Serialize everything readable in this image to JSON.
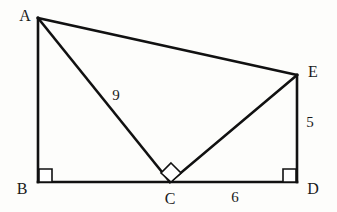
{
  "figure": {
    "background_color": "#fdfdfb",
    "stroke_color": "#111111",
    "label_color": "#1a1a1a",
    "width": 337,
    "height": 212,
    "vertices": [
      {
        "name": "A",
        "label": "A",
        "x": 38,
        "y": 18,
        "label_x": 25,
        "label_y": 16
      },
      {
        "name": "B",
        "label": "B",
        "x": 38,
        "y": 182,
        "label_x": 22,
        "label_y": 189
      },
      {
        "name": "C",
        "label": "C",
        "x": 170,
        "y": 182,
        "label_x": 170,
        "label_y": 199
      },
      {
        "name": "D",
        "label": "D",
        "x": 297,
        "y": 182,
        "label_x": 313,
        "label_y": 189
      },
      {
        "name": "E",
        "label": "E",
        "x": 297,
        "y": 75,
        "label_x": 313,
        "label_y": 72
      }
    ],
    "segments": [
      {
        "name": "segment-ab",
        "from": "A",
        "to": "B",
        "x1": 38,
        "y1": 18,
        "x2": 38,
        "y2": 182
      },
      {
        "name": "segment-bd",
        "from": "B",
        "to": "D",
        "x1": 38,
        "y1": 182,
        "x2": 297,
        "y2": 182
      },
      {
        "name": "segment-ae",
        "from": "A",
        "to": "E",
        "x1": 38,
        "y1": 18,
        "x2": 297,
        "y2": 75
      },
      {
        "name": "segment-ac",
        "from": "A",
        "to": "C",
        "x1": 38,
        "y1": 18,
        "x2": 170,
        "y2": 182
      },
      {
        "name": "segment-ce",
        "from": "C",
        "to": "E",
        "x1": 170,
        "y1": 182,
        "x2": 297,
        "y2": 75
      },
      {
        "name": "segment-ed",
        "from": "E",
        "to": "D",
        "x1": 297,
        "y1": 75,
        "x2": 297,
        "y2": 182
      }
    ],
    "measures": [
      {
        "name": "length-ac",
        "value": "9",
        "x": 116,
        "y": 95
      },
      {
        "name": "length-ed",
        "value": "5",
        "x": 310,
        "y": 122
      },
      {
        "name": "length-cd",
        "value": "6",
        "x": 235,
        "y": 197
      }
    ],
    "right_angles": [
      {
        "name": "right-angle-b",
        "at": "B",
        "style": "square",
        "points": "39,169 52,169 52,182 39,182"
      },
      {
        "name": "right-angle-d",
        "at": "D",
        "style": "square",
        "points": "283,169 296,169 296,182 283,182"
      },
      {
        "name": "right-angle-c",
        "at": "C",
        "style": "diamond",
        "points": "171,163 181,173 171,182 161,173"
      }
    ]
  }
}
